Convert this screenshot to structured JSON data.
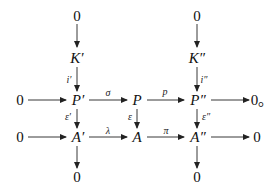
{
  "diagram": {
    "type": "commutative-diagram",
    "nodes": {
      "top_left_zero": "0",
      "top_right_zero": "0",
      "k_prime": "K′",
      "k_double_prime": "K″",
      "row1_left_zero": "0",
      "p_prime": "P′",
      "p": "P",
      "p_double_prime": "P″",
      "row1_right_zero": "0。",
      "row2_left_zero": "0",
      "a_prime": "A′",
      "a": "A",
      "a_double_prime": "A″",
      "row2_right_zero": "0",
      "bottom_left_zero": "0",
      "bottom_right_zero": "0"
    },
    "arrows": {
      "i_prime": "i′",
      "i_double_prime": "i″",
      "sigma": "σ",
      "p_map": "p",
      "epsilon_prime": "ε′",
      "epsilon": "ε",
      "epsilon_double_prime": "ε″",
      "lambda": "λ",
      "pi": "π"
    },
    "line_color": "#222222"
  }
}
